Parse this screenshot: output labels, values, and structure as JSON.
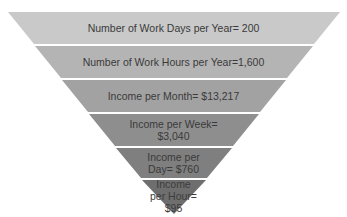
{
  "diagram": {
    "type": "inverted-pyramid",
    "levels": [
      {
        "label": "Number of Work Days per Year= 200",
        "color": "#c9c9c9"
      },
      {
        "label": "Number of Work Hours per Year=1,600",
        "color": "#b4b4b4"
      },
      {
        "label": "Income per Month= $13,217",
        "color": "#a2a2a2"
      },
      {
        "label": "Income per Week= $3,040",
        "color": "#8e8e8e"
      },
      {
        "label": "Income per Day= $760",
        "color": "#7f7f7f"
      },
      {
        "label": "Income per Hour= $95",
        "color": "#6e6e6e"
      }
    ],
    "separator_color": "#f2f2f2"
  }
}
